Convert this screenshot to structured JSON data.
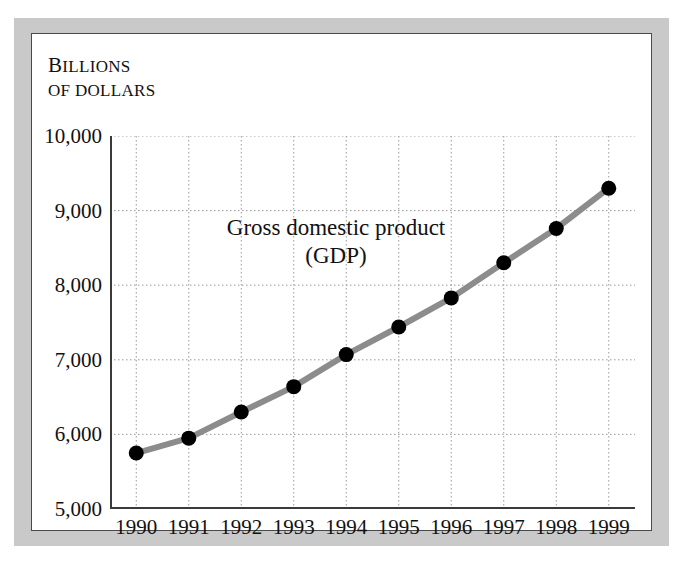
{
  "figure": {
    "unit_caption": {
      "line1": "Billions",
      "line2": "of dollars"
    }
  },
  "chart_data": {
    "type": "line",
    "title": "Gross domestic product (GDP)",
    "annotation_line1": "Gross domestic product",
    "annotation_line2": "(GDP)",
    "xlabel": "",
    "ylabel": "Billions of dollars",
    "categories": [
      "1990",
      "1991",
      "1992",
      "1993",
      "1994",
      "1995",
      "1996",
      "1997",
      "1998",
      "1999"
    ],
    "values": [
      5750,
      5950,
      6300,
      6640,
      7070,
      7440,
      7830,
      8300,
      8760,
      9300
    ],
    "ylim": [
      5000,
      10000
    ],
    "yticks": [
      5000,
      6000,
      7000,
      8000,
      9000,
      10000
    ],
    "ytick_labels": [
      "5,000",
      "6,000",
      "7,000",
      "8,000",
      "9,000",
      "10,000"
    ],
    "xticks": [
      "1990",
      "1991",
      "1992",
      "1993",
      "1994",
      "1995",
      "1996",
      "1997",
      "1998",
      "1999"
    ],
    "grid": true,
    "grid_style": "dotted",
    "legend": "none",
    "series": [
      {
        "name": "Gross domestic product (GDP)",
        "values": [
          5750,
          5950,
          6300,
          6640,
          7070,
          7440,
          7830,
          8300,
          8760,
          9300
        ]
      }
    ],
    "colors": {
      "line": "#8c8c8c",
      "marker": "#000000",
      "grid": "#9a9a9a",
      "axis": "#3a3a3a",
      "frame": "#c9c9c9",
      "background": "#ffffff"
    }
  }
}
